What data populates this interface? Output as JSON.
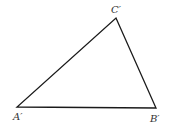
{
  "diagram": {
    "type": "triangle",
    "stroke_color": "#1a1a1a",
    "vertices": [
      {
        "id": "A",
        "label": "A′",
        "x": 17,
        "y": 107,
        "label_x": 13,
        "label_y": 120
      },
      {
        "id": "B",
        "label": "B′",
        "x": 156,
        "y": 108,
        "label_x": 150,
        "label_y": 122
      },
      {
        "id": "C",
        "label": "C′",
        "x": 116,
        "y": 18,
        "label_x": 111,
        "label_y": 13
      }
    ]
  }
}
